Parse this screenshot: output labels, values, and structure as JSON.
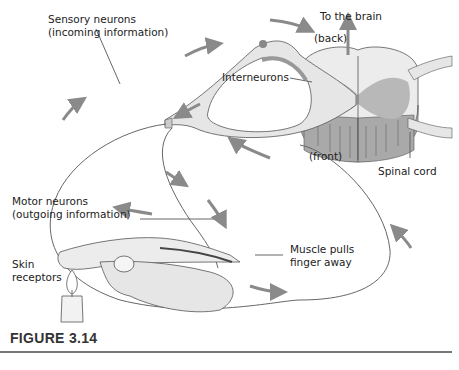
{
  "figure": {
    "caption": "FIGURE 3.14",
    "labels": {
      "to_brain": "To the brain",
      "back": "(back)",
      "sensory_line1": "Sensory neurons",
      "sensory_line2": "(incoming information)",
      "interneurons": "Interneurons",
      "front": "(front)",
      "spinal_cord": "Spinal cord",
      "motor_line1": "Motor neurons",
      "motor_line2": "(outgoing information)",
      "muscle_line1": "Muscle pulls",
      "muscle_line2": "finger away",
      "skin_line1": "Skin",
      "skin_line2": "receptors"
    },
    "colors": {
      "gray_matter": "#b8b8b8",
      "white_matter": "#ececec",
      "nerve_fill": "#e6e6e6",
      "arrow": "#8a8a8a",
      "line": "#555555"
    }
  }
}
